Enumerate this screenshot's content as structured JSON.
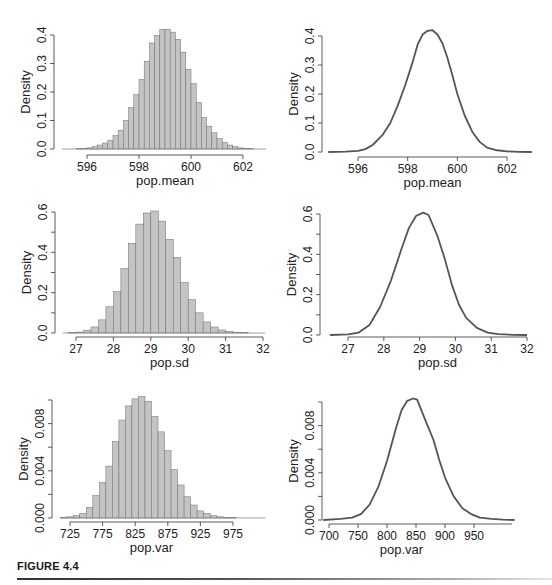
{
  "figure": {
    "caption": "FIGURE 4.4"
  },
  "colors": {
    "bar_fill": "#c4c4c4",
    "bar_stroke": "#6e6e6e",
    "line": "#555555",
    "axis": "#333333",
    "caption_rule_start": "#333333"
  },
  "chart_data": [
    {
      "id": "hist-mean",
      "type": "bar",
      "title": "",
      "xlabel": "pop.mean",
      "ylabel": "Density",
      "xlim": [
        594.7,
        602.9
      ],
      "ylim": [
        0,
        0.4
      ],
      "xticks": [
        596,
        598,
        600,
        602
      ],
      "yticks": [
        "0.0",
        "0.1",
        "0.2",
        "0.3",
        "0.4"
      ],
      "ytick_values": [
        0,
        0.1,
        0.2,
        0.3,
        0.4
      ],
      "bin_width": 0.2,
      "bin_start": 595.6,
      "values": [
        0.001,
        0.002,
        0.004,
        0.008,
        0.014,
        0.021,
        0.031,
        0.047,
        0.066,
        0.1,
        0.145,
        0.191,
        0.244,
        0.308,
        0.372,
        0.398,
        0.42,
        0.42,
        0.41,
        0.385,
        0.34,
        0.28,
        0.229,
        0.163,
        0.11,
        0.08,
        0.057,
        0.036,
        0.023,
        0.014,
        0.008,
        0.004,
        0.002,
        0.001
      ],
      "grid": false,
      "panel": {
        "x": 0,
        "y": 0,
        "w": 276,
        "h": 190,
        "plot_left": 54,
        "plot_right": 266,
        "plot_top": 35,
        "plot_bottom": 149,
        "axis_y": 155,
        "xtick_px": [
          87,
          243
        ]
      }
    },
    {
      "id": "density-mean",
      "type": "line",
      "title": "",
      "xlabel": "pop.mean",
      "ylabel": "Density",
      "xlim": [
        594.7,
        603.0
      ],
      "ylim": [
        0,
        0.4
      ],
      "xticks": [
        596,
        598,
        600,
        602
      ],
      "yticks": [
        "0.0",
        "0.1",
        "0.2",
        "0.3",
        "0.4"
      ],
      "ytick_values": [
        0,
        0.1,
        0.2,
        0.3,
        0.4
      ],
      "x": [
        594.8,
        595.5,
        596.0,
        596.3,
        596.6,
        597.0,
        597.3,
        597.6,
        597.9,
        598.2,
        598.4,
        598.6,
        598.8,
        599.0,
        599.2,
        599.4,
        599.6,
        599.8,
        600.0,
        600.3,
        600.6,
        600.9,
        601.2,
        601.6,
        602.0,
        602.5,
        603.0
      ],
      "values": [
        0.0,
        0.001,
        0.004,
        0.01,
        0.025,
        0.06,
        0.1,
        0.16,
        0.23,
        0.31,
        0.37,
        0.405,
        0.418,
        0.42,
        0.405,
        0.375,
        0.325,
        0.265,
        0.2,
        0.125,
        0.07,
        0.035,
        0.015,
        0.006,
        0.002,
        0.0005,
        0.0
      ],
      "grid": false,
      "panel": {
        "x": 276,
        "y": 0,
        "w": 276,
        "h": 190,
        "plot_left": 322,
        "plot_right": 532,
        "plot_top": 36,
        "plot_bottom": 152,
        "axis_y": 157,
        "xtick_px": [
          358,
          507
        ]
      }
    },
    {
      "id": "hist-sd",
      "type": "bar",
      "title": "",
      "xlabel": "pop.sd",
      "ylabel": "Density",
      "xlim": [
        26.44,
        32.0
      ],
      "ylim": [
        0,
        0.6
      ],
      "xticks": [
        27,
        28,
        29,
        30,
        31,
        32
      ],
      "yticks": [
        "0.0",
        "0.2",
        "0.4",
        "0.6"
      ],
      "ytick_values": [
        0,
        0.2,
        0.4,
        0.6
      ],
      "minor_yticks": [
        0.1,
        0.3,
        0.5
      ],
      "bin_width": 0.2,
      "bin_start": 26.8,
      "values": [
        0.002,
        0.005,
        0.014,
        0.03,
        0.065,
        0.13,
        0.205,
        0.32,
        0.445,
        0.54,
        0.595,
        0.605,
        0.555,
        0.465,
        0.375,
        0.25,
        0.165,
        0.1,
        0.055,
        0.03,
        0.015,
        0.008,
        0.004,
        0.002
      ],
      "grid": false,
      "panel": {
        "x": 0,
        "y": 190,
        "w": 276,
        "h": 190,
        "plot_left": 55,
        "plot_right": 265,
        "plot_top": 212,
        "plot_bottom": 333,
        "axis_y": 337,
        "xtick_px": [
          76,
          263
        ]
      }
    },
    {
      "id": "density-sd",
      "type": "line",
      "title": "",
      "xlabel": "pop.sd",
      "ylabel": "Density",
      "xlim": [
        26.5,
        32.0
      ],
      "ylim": [
        0,
        0.6
      ],
      "xticks": [
        27,
        28,
        29,
        30,
        31,
        32
      ],
      "yticks": [
        "0.0",
        "0.2",
        "0.4",
        "0.6"
      ],
      "ytick_values": [
        0,
        0.2,
        0.4,
        0.6
      ],
      "minor_yticks": [
        0.1,
        0.3,
        0.5
      ],
      "x": [
        26.5,
        27.0,
        27.3,
        27.6,
        27.9,
        28.2,
        28.5,
        28.7,
        28.9,
        29.1,
        29.25,
        29.5,
        29.7,
        29.9,
        30.1,
        30.3,
        30.6,
        30.9,
        31.2,
        31.6,
        32.0
      ],
      "values": [
        0.0,
        0.003,
        0.012,
        0.05,
        0.14,
        0.27,
        0.43,
        0.53,
        0.59,
        0.607,
        0.595,
        0.49,
        0.38,
        0.25,
        0.15,
        0.085,
        0.035,
        0.012,
        0.004,
        0.001,
        0.0
      ],
      "grid": false,
      "panel": {
        "x": 276,
        "y": 190,
        "w": 276,
        "h": 190,
        "plot_left": 320,
        "plot_right": 530,
        "plot_top": 214,
        "plot_bottom": 335,
        "axis_y": 337,
        "xtick_px": [
          348,
          527
        ]
      }
    },
    {
      "id": "hist-var",
      "type": "bar",
      "title": "",
      "xlabel": "pop.var",
      "ylabel": "Density",
      "xlim": [
        698,
        1010
      ],
      "ylim": [
        0,
        0.01
      ],
      "xticks": [
        725,
        775,
        825,
        875,
        925,
        975
      ],
      "yticks": [
        "0.000",
        "0.004",
        "0.008"
      ],
      "ytick_values": [
        0,
        0.004,
        0.008
      ],
      "minor_yticks": [
        0.002,
        0.006,
        0.01
      ],
      "bin_width": 10,
      "bin_start": 710,
      "values": [
        5e-05,
        0.0001,
        0.0002,
        0.0004,
        0.0009,
        0.0019,
        0.003,
        0.0044,
        0.0065,
        0.0083,
        0.0095,
        0.0101,
        0.0103,
        0.0099,
        0.0086,
        0.0073,
        0.0057,
        0.0041,
        0.0028,
        0.0018,
        0.0011,
        0.0006,
        0.0004,
        0.0002,
        0.0001,
        5e-05,
        3e-05
      ],
      "grid": false,
      "panel": {
        "x": 0,
        "y": 380,
        "w": 276,
        "h": 205,
        "plot_left": 52,
        "plot_right": 265,
        "plot_top": 400,
        "plot_bottom": 518,
        "axis_y": 522,
        "xtick_px": [
          70,
          233
        ]
      }
    },
    {
      "id": "density-var",
      "type": "line",
      "title": "",
      "xlabel": "pop.var",
      "ylabel": "Density",
      "xlim": [
        690,
        1020
      ],
      "ylim": [
        0,
        0.01
      ],
      "xticks": [
        700,
        750,
        800,
        850,
        900,
        950
      ],
      "yticks": [
        "0.000",
        "0.004",
        "0.008"
      ],
      "ytick_values": [
        0,
        0.004,
        0.008
      ],
      "minor_yticks": [
        0.002,
        0.006,
        0.01
      ],
      "x": [
        690,
        720,
        740,
        755,
        770,
        785,
        800,
        815,
        825,
        835,
        845,
        852,
        860,
        870,
        880,
        890,
        900,
        915,
        930,
        945,
        960,
        980,
        1000,
        1020
      ],
      "values": [
        0.0,
        0.0001,
        0.0002,
        0.0005,
        0.0013,
        0.0028,
        0.005,
        0.0077,
        0.0093,
        0.0101,
        0.0103,
        0.0102,
        0.0092,
        0.008,
        0.0068,
        0.0051,
        0.0036,
        0.002,
        0.001,
        0.0005,
        0.0002,
        0.0001,
        3e-05,
        0.0
      ],
      "grid": false,
      "panel": {
        "x": 276,
        "y": 380,
        "w": 276,
        "h": 205,
        "plot_left": 322,
        "plot_right": 532,
        "plot_top": 402,
        "plot_bottom": 520,
        "axis_y": 524,
        "xtick_px": [
          329,
          474
        ],
        "axis_end_px": 512
      }
    }
  ]
}
